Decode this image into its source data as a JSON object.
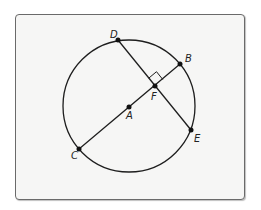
{
  "diagram": {
    "type": "circle-geometry",
    "circle": {
      "center_label": "A",
      "cx": 129,
      "cy": 106,
      "r": 66
    },
    "points": [
      {
        "label": "D",
        "x": 118,
        "y": 40,
        "lx": 110,
        "ly": 38
      },
      {
        "label": "B",
        "x": 180,
        "y": 64,
        "lx": 185,
        "ly": 62
      },
      {
        "label": "F",
        "x": 155,
        "y": 86,
        "lx": 151,
        "ly": 100
      },
      {
        "label": "A",
        "x": 129,
        "y": 107,
        "lx": 126,
        "ly": 119
      },
      {
        "label": "C",
        "x": 79,
        "y": 149,
        "lx": 71,
        "ly": 159
      },
      {
        "label": "E",
        "x": 191,
        "y": 130,
        "lx": 194,
        "ly": 142
      }
    ],
    "segments": [
      {
        "from": "C",
        "to": "B",
        "name": "diameter-CB"
      },
      {
        "from": "D",
        "to": "E",
        "name": "chord-DE"
      }
    ],
    "right_angle_at": "F",
    "colors": {
      "stroke": "#1e1e1e",
      "background": "#f6f6f5",
      "frame": "#6a6a6a"
    }
  }
}
